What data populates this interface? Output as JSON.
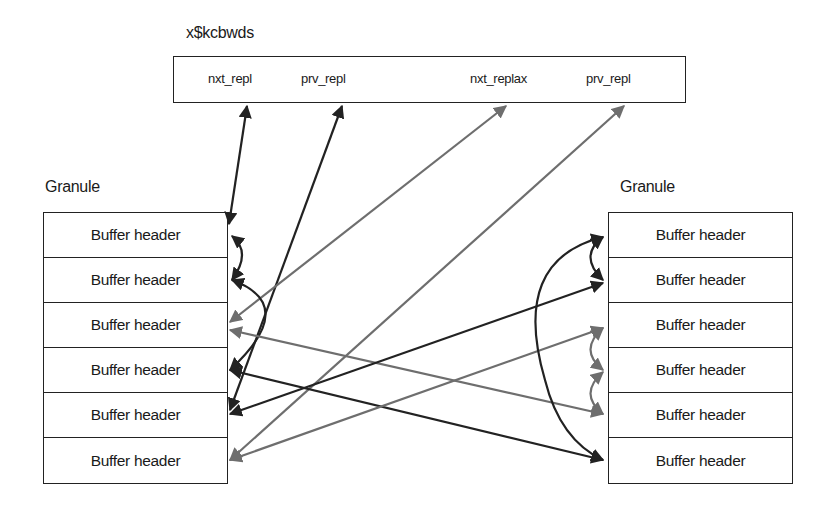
{
  "structure": {
    "title": "x$kcbwds",
    "fields": [
      {
        "name": "nxt_repl",
        "x": 34
      },
      {
        "name": "prv_repl",
        "x": 127
      },
      {
        "name": "nxt_replax",
        "x": 296
      },
      {
        "name": "prv_repl",
        "x": 412
      }
    ]
  },
  "granules": {
    "left": {
      "label": "Granule",
      "rows": [
        "Buffer header",
        "Buffer header",
        "Buffer header",
        "Buffer header",
        "Buffer header",
        "Buffer header"
      ]
    },
    "right": {
      "label": "Granule",
      "rows": [
        "Buffer header",
        "Buffer header",
        "Buffer header",
        "Buffer header",
        "Buffer header",
        "Buffer header"
      ]
    }
  },
  "colors": {
    "dark_arrow": "#222222",
    "gray_arrow": "#6e6e6e",
    "border": "#222222"
  }
}
